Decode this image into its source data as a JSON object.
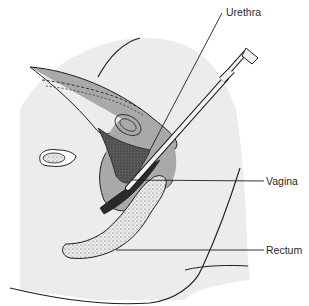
{
  "figure": {
    "labels": [
      {
        "id": "urethra",
        "text": "Urethra"
      },
      {
        "id": "vagina",
        "text": "Vagina"
      },
      {
        "id": "rectum",
        "text": "Rectum"
      }
    ],
    "colors": {
      "background": "#ffffff",
      "body_section": "#ececec",
      "organ_gray": "#a9a9a9",
      "dark_tissue": "#5c5c5c",
      "outline": "#1e1e1e",
      "stipple": "#e6e6e6"
    }
  }
}
